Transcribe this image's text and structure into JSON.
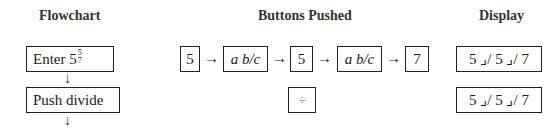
{
  "headers": {
    "flowchart": "Flowchart",
    "buttons": "Buttons Pushed",
    "display": "Display"
  },
  "flowchart": {
    "steps": [
      {
        "label": "Enter 5",
        "frac_num": "5",
        "frac_den": "7"
      },
      {
        "label": "Push divide"
      }
    ]
  },
  "buttons": {
    "row1": [
      "5",
      "a b/c",
      "5",
      "a b/c",
      "7"
    ],
    "arrow": "→",
    "row2": [
      "÷"
    ]
  },
  "display": {
    "values": [
      "5 ⌟/ 5 ⌟/ 7",
      "5 ⌟/ 5 ⌟/ 7"
    ]
  },
  "down_arrow": "↓"
}
